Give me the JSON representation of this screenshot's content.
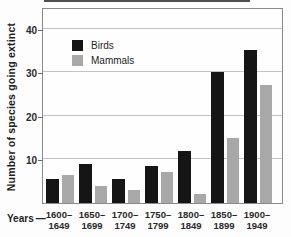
{
  "chart_data": {
    "type": "bar",
    "title": "",
    "xlabel": "Years",
    "ylabel": "Number of species going extinct",
    "categories": [
      "1600–1649",
      "1650–1699",
      "1700–1749",
      "1750–1799",
      "1800–1849",
      "1850–1899",
      "1900–1949"
    ],
    "series": [
      {
        "name": "Birds",
        "color": "#151515",
        "values": [
          5.5,
          9,
          5.5,
          8.5,
          12,
          30,
          35
        ]
      },
      {
        "name": "Mammals",
        "color": "#a8a8a8",
        "values": [
          6.5,
          4,
          3,
          7,
          2,
          15,
          27
        ]
      }
    ],
    "yticks": [
      10,
      20,
      30,
      40
    ],
    "ylim": [
      0,
      44.5
    ],
    "grid": true,
    "legend_position": "upper-left-inside"
  },
  "ui": {
    "years_dash": "—"
  },
  "colors": {
    "grid": "#c4c4c4",
    "plot_border": "#8a8a8a",
    "background": "#fdfdfd"
  }
}
